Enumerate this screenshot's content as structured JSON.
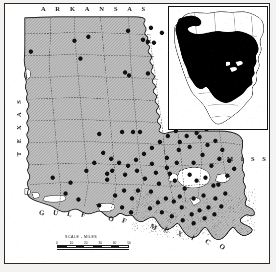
{
  "figure": {
    "kind": "species-distribution-map",
    "region": "Louisiana",
    "frame_color": "#2b2b2b",
    "land_fill": "#b9b9b9",
    "water_fill": "#ffffff",
    "dot_color": "#111111",
    "range_fill": "#000000"
  },
  "labels": {
    "arkansas": "A R K A N S A S",
    "texas": "T E X A S",
    "mississippi": "M I S S .",
    "gulf_of_mexico": "GULF OF MEXICO"
  },
  "scale": {
    "title": "SCALE - MILES",
    "ticks": [
      "0",
      "10",
      "20",
      "30",
      "40",
      "50"
    ],
    "segments": 8
  },
  "inset": {
    "name": "north-america-range-inset",
    "caption": ""
  },
  "chart_data": {
    "type": "scatter",
    "xlabel": "",
    "ylabel": "",
    "xlim": [
      0,
      260
    ],
    "ylim": [
      0,
      256
    ],
    "grid": false,
    "legend": null,
    "series": [
      {
        "name": "collection-localities",
        "marker": "filled-circle",
        "marker_size": 4.4,
        "color": "#111111",
        "points": [
          [
            70,
            37
          ],
          [
            124,
            27
          ],
          [
            147,
            24
          ],
          [
            158,
            29
          ],
          [
            139,
            36
          ],
          [
            144,
            38
          ],
          [
            150,
            39
          ],
          [
            172,
            32
          ],
          [
            26,
            48
          ],
          [
            84,
            33
          ],
          [
            76,
            55
          ],
          [
            121,
            69
          ],
          [
            125,
            72
          ],
          [
            144,
            70
          ],
          [
            95,
            131
          ],
          [
            118,
            129
          ],
          [
            129,
            129
          ],
          [
            136,
            129
          ],
          [
            103,
            171
          ],
          [
            103,
            177
          ],
          [
            48,
            175
          ],
          [
            66,
            180
          ],
          [
            61,
            191
          ],
          [
            74,
            197
          ],
          [
            95,
            203
          ],
          [
            108,
            168
          ],
          [
            121,
            172
          ],
          [
            133,
            168
          ],
          [
            148,
            161
          ],
          [
            163,
            155
          ],
          [
            175,
            147
          ],
          [
            166,
            171
          ],
          [
            171,
            178
          ],
          [
            155,
            181
          ],
          [
            147,
            189
          ],
          [
            134,
            188
          ],
          [
            128,
            196
          ],
          [
            118,
            205
          ],
          [
            127,
            210
          ],
          [
            176,
            139
          ],
          [
            186,
            144
          ],
          [
            196,
            134
          ],
          [
            204,
            142
          ],
          [
            199,
            152
          ],
          [
            190,
            160
          ],
          [
            208,
            163
          ],
          [
            216,
            156
          ],
          [
            186,
            172
          ],
          [
            193,
            178
          ],
          [
            202,
            175
          ],
          [
            210,
            183
          ],
          [
            181,
            186
          ],
          [
            176,
            194
          ],
          [
            190,
            196
          ],
          [
            200,
            193
          ],
          [
            212,
            196
          ],
          [
            205,
            205
          ],
          [
            196,
            208
          ],
          [
            188,
            212
          ],
          [
            178,
            205
          ],
          [
            170,
            199
          ],
          [
            162,
            196
          ],
          [
            154,
            200
          ],
          [
            146,
            206
          ],
          [
            158,
            210
          ],
          [
            168,
            214
          ],
          [
            179,
            218
          ],
          [
            190,
            221
          ],
          [
            201,
            216
          ],
          [
            211,
            212
          ],
          [
            218,
            204
          ],
          [
            222,
            191
          ],
          [
            215,
            182
          ],
          [
            224,
            173
          ],
          [
            231,
            166
          ],
          [
            226,
            158
          ],
          [
            219,
            147
          ],
          [
            212,
            138
          ],
          [
            203,
            126
          ],
          [
            193,
            130
          ],
          [
            183,
            133
          ],
          [
            172,
            128
          ],
          [
            164,
            133
          ],
          [
            156,
            139
          ],
          [
            148,
            145
          ],
          [
            140,
            151
          ],
          [
            132,
            157
          ],
          [
            124,
            163
          ],
          [
            115,
            160
          ],
          [
            107,
            156
          ],
          [
            99,
            150
          ],
          [
            90,
            160
          ],
          [
            82,
            168
          ],
          [
            120,
            188
          ],
          [
            111,
            193
          ],
          [
            141,
            176
          ],
          [
            152,
            170
          ],
          [
            163,
            165
          ],
          [
            173,
            160
          ]
        ]
      }
    ],
    "annotations": [
      {
        "text": "A R K A N S A S",
        "position": "top"
      },
      {
        "text": "T E X A S",
        "position": "left"
      },
      {
        "text": "M I S S .",
        "position": "right"
      },
      {
        "text": "GULF OF MEXICO",
        "position": "bottom"
      }
    ]
  }
}
